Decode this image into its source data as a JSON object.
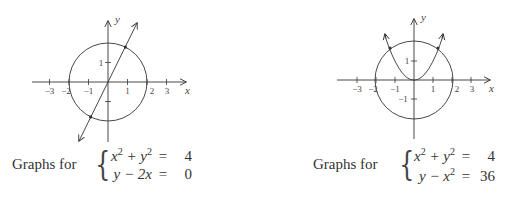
{
  "graphs": [
    {
      "id": "graph-1",
      "axes": {
        "x_label": "x",
        "y_label": "y",
        "x_ticks": [
          "−3",
          "−2",
          "−1",
          "1",
          "2",
          "3"
        ],
        "y_ticks": [
          "1"
        ],
        "y_tick_marks": [
          1,
          -1
        ]
      },
      "curves": [
        "circle x^2 + y^2 = 4",
        "line y = 2x"
      ],
      "intersection_points": 2,
      "caption": "Graphs for",
      "system": [
        {
          "lhs_base": "x",
          "lhs_mid": " + y",
          "lhs_tail": "",
          "op": "=",
          "rhs": "4",
          "kind": "circle"
        },
        {
          "lhs": "y − 2x",
          "op": "=",
          "rhs": "0",
          "kind": "line"
        }
      ]
    },
    {
      "id": "graph-2",
      "axes": {
        "x_label": "x",
        "y_label": "y",
        "x_ticks": [
          "−3",
          "−2",
          "−1",
          "1",
          "2",
          "3"
        ],
        "y_ticks": [
          "1",
          "−1"
        ],
        "y_tick_marks": [
          1,
          -1
        ]
      },
      "curves": [
        "circle x^2 + y^2 = 4",
        "parabola y = x^2"
      ],
      "intersection_points": 2,
      "caption": "Graphs for",
      "system": [
        {
          "lhs_base": "x",
          "lhs_mid": " + y",
          "lhs_tail": "",
          "op": "=",
          "rhs": "4",
          "kind": "circle"
        },
        {
          "lhs_base": "y − x",
          "lhs_tail": "",
          "op": "=",
          "rhs": "36",
          "kind": "parabola"
        }
      ]
    }
  ],
  "colors": {
    "stroke": "#333333",
    "text": "#333333",
    "background": "#ffffff"
  }
}
